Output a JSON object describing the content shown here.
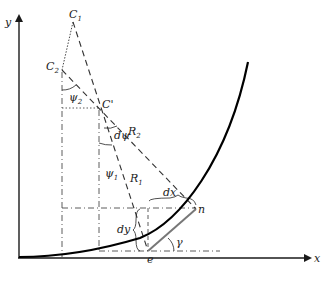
{
  "diagram": {
    "title": "",
    "axes": {
      "x_label": "x",
      "y_label": "y"
    },
    "points": {
      "C1": {
        "label": "C",
        "sub": "1"
      },
      "C2": {
        "label": "C",
        "sub": "2"
      },
      "Cprime": {
        "label": "C'"
      },
      "e": {
        "label": "e"
      },
      "n": {
        "label": "n"
      }
    },
    "labels": {
      "psi2": {
        "sym": "ψ",
        "sub": "2"
      },
      "psi1": {
        "sym": "ψ",
        "sub": "1"
      },
      "dpsi": {
        "d": "d",
        "sym": "ψ"
      },
      "R1": {
        "sym": "R",
        "sub": "1"
      },
      "R2": {
        "sym": "R",
        "sub": "2"
      },
      "dx": {
        "d": "d",
        "sym": "x"
      },
      "dy": {
        "d": "d",
        "sym": "y"
      },
      "gamma": "γ"
    },
    "colors": {
      "stroke": "#1a1a1a",
      "curve": "#000000",
      "chord": "#777777"
    }
  }
}
